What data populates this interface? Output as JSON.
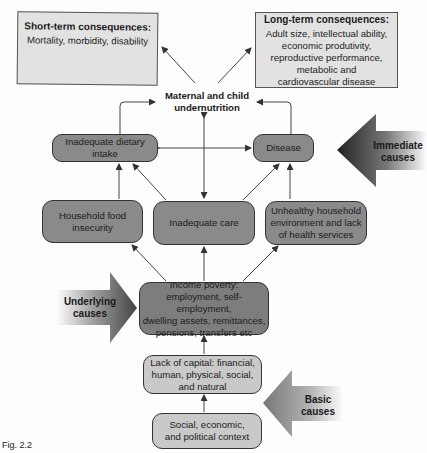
{
  "diagram": {
    "short_term": {
      "title": "Short-term consequences:",
      "body": "Mortality, morbidity, disability"
    },
    "long_term": {
      "title": "Long-term consequences:",
      "lines": [
        "Adult size, intellectual ability,",
        "economic produtivity,",
        "reproductive performance,",
        "metabolic and",
        "cardiovascular disease"
      ]
    },
    "outcome": {
      "lines": [
        "Maternal and child",
        "undernutrition"
      ]
    },
    "immediate": {
      "dietary": "Inadequate dietary intake",
      "disease": "Disease"
    },
    "underlying": {
      "food": [
        "Household food",
        "insecurity"
      ],
      "care": "Inadequate care",
      "environment": [
        "Unhealthy household",
        "environment and lack",
        "of health services"
      ],
      "income": [
        "Income poverty:",
        "employment, self-employment,",
        "dwelling assets, remittances,",
        "pensions, transfers etc"
      ]
    },
    "basic": {
      "capital": [
        "Lack of capital: financial,",
        "human, physical, social,",
        "and natural"
      ],
      "context": [
        "Social, economic,",
        "and political context"
      ]
    },
    "cause_arrows": {
      "immediate": [
        "Immediate",
        "causes"
      ],
      "underlying": [
        "Underlying",
        "causes"
      ],
      "basic": [
        "Basic",
        "causes"
      ]
    },
    "caption": "Fig. 2.2"
  },
  "colors": {
    "rect_fill": "#e2e2e2",
    "dark_fill": "#8a8a8a",
    "light_fill": "#c9c9c9",
    "line": "#444444"
  }
}
